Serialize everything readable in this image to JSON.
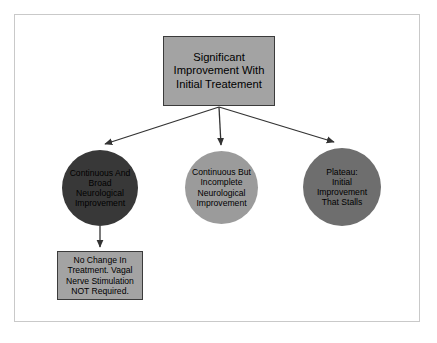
{
  "diagram": {
    "type": "flowchart",
    "background_color": "#ffffff",
    "border_color": "#c9c9c9",
    "nodes": [
      {
        "id": "top",
        "shape": "rectangle",
        "label": "Significant\nImprovement With\nInitial Treatement",
        "fill": "#a3a3a3",
        "stroke": "#3b3b3b",
        "text_color": "#000000"
      },
      {
        "id": "circle-1",
        "shape": "circle",
        "label": "Continuous And\nBroad\nNeurological\nImprovement",
        "fill": "#383838",
        "stroke": "#2b2b2b",
        "text_color": "#000000"
      },
      {
        "id": "circle-2",
        "shape": "circle",
        "label": "Continuous But\nIncomplete\nNeurological\nImprovement",
        "fill": "#9b9b9b",
        "stroke": "#6f6f6f",
        "text_color": "#000000"
      },
      {
        "id": "circle-3",
        "shape": "circle",
        "label": "Plateau:\nInitial\nImprovement\nThat Stalls",
        "fill": "#6e6e6e",
        "stroke": "#4f4f4f",
        "text_color": "#000000"
      },
      {
        "id": "bottom",
        "shape": "rectangle",
        "label": "No Change In\nTreatment. Vagal\nNerve Stimulation\nNOT Required.",
        "fill": "#a3a3a3",
        "stroke": "#3b3b3b",
        "text_color": "#000000"
      }
    ],
    "edges": [
      {
        "id": "edge-top-to-circle-1",
        "from": "top",
        "to": "circle-1",
        "arrow": "end",
        "color": "#333333"
      },
      {
        "id": "edge-top-to-circle-2",
        "from": "top",
        "to": "circle-2",
        "arrow": "end",
        "color": "#333333"
      },
      {
        "id": "edge-top-to-circle-3",
        "from": "top",
        "to": "circle-3",
        "arrow": "end",
        "color": "#333333"
      },
      {
        "id": "edge-circle-1-to-bottom",
        "from": "circle-1",
        "to": "bottom",
        "arrow": "end",
        "color": "#333333"
      }
    ]
  }
}
